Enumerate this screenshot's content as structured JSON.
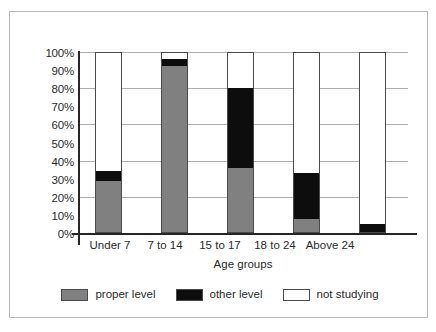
{
  "chart_data": {
    "type": "bar",
    "title": "",
    "subtitle": "",
    "xlabel": "Age groups",
    "ylabel": "",
    "stacked": true,
    "stack_total": 100,
    "grid": true,
    "legend_position": "bottom",
    "ylim": [
      0,
      100
    ],
    "ytick_labels": [
      "0%",
      "10%",
      "20%",
      "30%",
      "40%",
      "50%",
      "60%",
      "70%",
      "80%",
      "90%",
      "100%"
    ],
    "ytick_values": [
      0,
      10,
      20,
      30,
      40,
      50,
      60,
      70,
      80,
      90,
      100
    ],
    "gridline_values": [
      20,
      40,
      60,
      80,
      100
    ],
    "categories": [
      "Under 7",
      "7 to 14",
      "15 to 17",
      "18 to 24",
      "Above 24"
    ],
    "series": [
      {
        "name": "proper level",
        "color": "#808080",
        "values": [
          29,
          92,
          36,
          8,
          0
        ]
      },
      {
        "name": "other level",
        "color": "#0d0d0d",
        "values": [
          5,
          4,
          44,
          25,
          5
        ]
      },
      {
        "name": "not studying",
        "color": "#ffffff",
        "values": [
          66,
          4,
          20,
          67,
          95
        ]
      }
    ]
  },
  "legend": {
    "entries": [
      {
        "label": "proper level",
        "swatch": "proper"
      },
      {
        "label": "other level",
        "swatch": "other"
      },
      {
        "label": "not studying",
        "swatch": "notstudy"
      }
    ]
  },
  "colors": {
    "proper_level": "#808080",
    "other_level": "#0d0d0d",
    "not_studying": "#ffffff",
    "axis": "#262626",
    "gridline": "#b0b0b0",
    "border": "#b9b9b9",
    "text": "#2b2b2b"
  }
}
